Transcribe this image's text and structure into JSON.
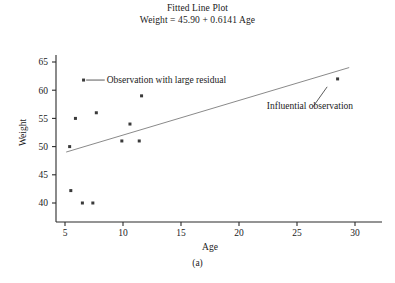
{
  "figure": {
    "title_line1": "Fitted Line Plot",
    "title_line2": "Weight = 45.90 + 0.6141 Age",
    "caption": "(a)"
  },
  "chart_data": {
    "type": "scatter",
    "title": "Fitted Line Plot",
    "subtitle": "Weight = 45.90 + 0.6141 Age",
    "xlabel": "Age",
    "ylabel": "Weight",
    "xlim": [
      3.8,
      30.8
    ],
    "ylim": [
      37.8,
      66.5
    ],
    "xticks": [
      5,
      10,
      15,
      20,
      25,
      30
    ],
    "yticks": [
      40,
      45,
      50,
      55,
      60,
      65
    ],
    "grid": false,
    "legend": false,
    "series": [
      {
        "name": "Observations",
        "marker": "square",
        "color": "#3a3a3a",
        "points": [
          {
            "x": 5.4,
            "y": 50.0
          },
          {
            "x": 5.5,
            "y": 42.2
          },
          {
            "x": 5.9,
            "y": 55.0
          },
          {
            "x": 6.5,
            "y": 40.0
          },
          {
            "x": 7.4,
            "y": 40.0
          },
          {
            "x": 7.7,
            "y": 56.0
          },
          {
            "x": 6.6,
            "y": 61.8
          },
          {
            "x": 9.9,
            "y": 51.0
          },
          {
            "x": 10.6,
            "y": 54.0
          },
          {
            "x": 11.4,
            "y": 51.0
          },
          {
            "x": 11.6,
            "y": 59.0
          },
          {
            "x": 28.5,
            "y": 62.0
          }
        ]
      }
    ],
    "fit_line": {
      "name": "Fitted regression line",
      "equation": "Weight = 45.90 + 0.6141 Age",
      "intercept": 45.9,
      "slope": 0.6141,
      "color": "#8a8a8a",
      "x_start": 5.1,
      "x_end": 29.5
    },
    "annotations": [
      {
        "text": "Observation with large residual",
        "target_x": 6.6,
        "target_y": 61.8,
        "label_x": 8.6,
        "label_y": 61.8
      },
      {
        "text": "Influential observation",
        "target_x": 27.6,
        "target_y": 60.6,
        "label_x": 22.4,
        "label_y": 57.2
      }
    ]
  }
}
